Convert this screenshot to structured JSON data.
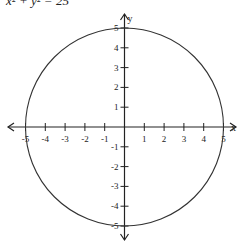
{
  "title": "x² + y² = 25",
  "chart_data": {
    "type": "line",
    "title": "x² + y² = 25",
    "xlabel": "x",
    "ylabel": "y",
    "xlim": [
      -5,
      5
    ],
    "ylim": [
      -5,
      5
    ],
    "grid": false,
    "x_ticks": [
      -5,
      -4,
      -3,
      -2,
      -1,
      1,
      2,
      3,
      4,
      5
    ],
    "y_ticks": [
      -5,
      -4,
      -3,
      -2,
      -1,
      1,
      2,
      3,
      4,
      5
    ],
    "series": [
      {
        "name": "circle",
        "center": [
          0,
          0
        ],
        "radius": 5
      }
    ]
  }
}
